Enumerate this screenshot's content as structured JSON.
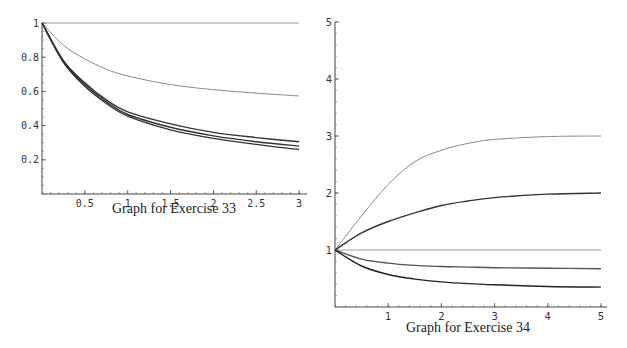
{
  "chart_data": [
    {
      "type": "line",
      "title": "Graph for Exercise 33",
      "xlabel": "",
      "ylabel": "",
      "xlim": [
        0,
        3
      ],
      "ylim": [
        0,
        1
      ],
      "x_ticks": [
        "0.5",
        "1",
        "1.5",
        "2",
        "2.5",
        "3"
      ],
      "y_ticks": [
        "0.2",
        "0.4",
        "0.6",
        "0.8",
        "1"
      ],
      "grid": false,
      "x": [
        0,
        0.25,
        0.5,
        0.75,
        1,
        1.5,
        2,
        2.5,
        3
      ],
      "series": [
        {
          "name": "constant",
          "color": "#9a9a9a",
          "values": [
            1,
            1,
            1,
            1,
            1,
            1,
            1,
            1,
            1
          ]
        },
        {
          "name": "upper",
          "color": "#8a8a8a",
          "values": [
            1,
            0.87,
            0.79,
            0.73,
            0.69,
            0.64,
            0.61,
            0.59,
            0.573
          ]
        },
        {
          "name": "lower-1",
          "color": "#333333",
          "values": [
            1,
            0.78,
            0.65,
            0.55,
            0.48,
            0.41,
            0.36,
            0.33,
            0.305
          ]
        },
        {
          "name": "lower-2",
          "color": "#333333",
          "values": [
            1,
            0.775,
            0.64,
            0.54,
            0.465,
            0.39,
            0.34,
            0.305,
            0.28
          ]
        },
        {
          "name": "lower-3",
          "color": "#333333",
          "values": [
            1,
            0.77,
            0.63,
            0.53,
            0.455,
            0.375,
            0.325,
            0.29,
            0.26
          ]
        }
      ]
    },
    {
      "type": "line",
      "title": "Graph for Exercise 34",
      "xlabel": "",
      "ylabel": "",
      "xlim": [
        0,
        5
      ],
      "ylim": [
        0,
        5
      ],
      "x_ticks": [
        "1",
        "2",
        "3",
        "4",
        "5"
      ],
      "y_ticks": [
        "1",
        "2",
        "3",
        "4",
        "5"
      ],
      "grid": false,
      "x": [
        0,
        0.5,
        1,
        1.5,
        2,
        2.5,
        3,
        4,
        5
      ],
      "series": [
        {
          "name": "to-3",
          "color": "#8a8a8a",
          "values": [
            1,
            1.6,
            2.15,
            2.55,
            2.75,
            2.87,
            2.94,
            2.99,
            3.0
          ]
        },
        {
          "name": "to-2",
          "color": "#333333",
          "values": [
            1,
            1.3,
            1.5,
            1.65,
            1.78,
            1.86,
            1.92,
            1.98,
            2.0
          ]
        },
        {
          "name": "constant-1",
          "color": "#9a9a9a",
          "values": [
            1,
            1,
            1,
            1,
            1,
            1,
            1,
            1,
            1
          ]
        },
        {
          "name": "to-0.67",
          "color": "#555555",
          "values": [
            1,
            0.84,
            0.77,
            0.73,
            0.71,
            0.7,
            0.69,
            0.68,
            0.67
          ]
        },
        {
          "name": "to-0.35",
          "color": "#222222",
          "values": [
            1,
            0.72,
            0.57,
            0.49,
            0.44,
            0.41,
            0.39,
            0.36,
            0.35
          ]
        }
      ]
    }
  ],
  "captions": {
    "left": "Graph for Exercise 33",
    "right": "Graph for Exercise 34"
  }
}
